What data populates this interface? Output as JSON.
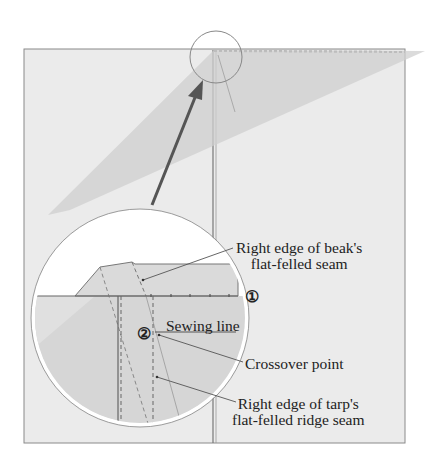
{
  "diagram": {
    "type": "sewing-instruction-illustration",
    "colors": {
      "panel": "#ebebeb",
      "beak": "#d2d2d2",
      "outline": "#8a8a8a",
      "arrow": "#555555",
      "text": "#222222"
    },
    "labels": {
      "beak_edge_line1": "Right edge of beak's",
      "beak_edge_line2": "flat-felled seam",
      "sewing_line": "Sewing line",
      "crossover": "Crossover point",
      "tarp_edge_line1": "Right edge of tarp's",
      "tarp_edge_line2": "flat-felled ridge seam"
    },
    "markers": {
      "one": "①",
      "two": "②"
    }
  }
}
